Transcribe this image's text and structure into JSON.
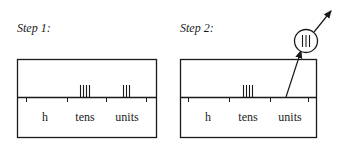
{
  "step1": {
    "title": "Step 1:",
    "columns": [
      "h",
      "tens",
      "units"
    ],
    "counters": {
      "h": 0,
      "tens": 4,
      "units": 3
    }
  },
  "step2": {
    "title": "Step 2:",
    "columns": [
      "h",
      "tens",
      "units"
    ],
    "counters": {
      "h": 0,
      "tens": 4,
      "units": 0
    },
    "removed_group": {
      "from": "units",
      "count": 3,
      "symbol": "III"
    }
  },
  "colors": {
    "ink": "#1a1a1a",
    "background": "#ffffff"
  }
}
